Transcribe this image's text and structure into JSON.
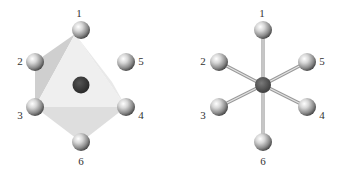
{
  "diagrams": [
    {
      "name": "octahedron-polyhedral-view",
      "center": {
        "x": 81,
        "y": 85,
        "color": "#3a3a3a"
      },
      "ligands": [
        {
          "label": "1",
          "x": 81,
          "y": 30,
          "lx": 79,
          "ly": 14
        },
        {
          "label": "2",
          "x": 35,
          "y": 62,
          "lx": 20,
          "ly": 62
        },
        {
          "label": "3",
          "x": 35,
          "y": 107,
          "lx": 20,
          "ly": 116
        },
        {
          "label": "4",
          "x": 126,
          "y": 107,
          "lx": 141,
          "ly": 116
        },
        {
          "label": "5",
          "x": 126,
          "y": 62,
          "lx": 141,
          "ly": 62
        },
        {
          "label": "6",
          "x": 81,
          "y": 142,
          "lx": 81,
          "ly": 162
        }
      ]
    },
    {
      "name": "octahedron-ball-and-stick-view",
      "center": {
        "x": 263,
        "y": 85,
        "color": "#555555"
      },
      "ligands": [
        {
          "label": "1",
          "x": 263,
          "y": 30,
          "lx": 262,
          "ly": 14
        },
        {
          "label": "2",
          "x": 219,
          "y": 62,
          "lx": 203,
          "ly": 62
        },
        {
          "label": "3",
          "x": 219,
          "y": 107,
          "lx": 203,
          "ly": 116
        },
        {
          "label": "4",
          "x": 307,
          "y": 107,
          "lx": 322,
          "ly": 116
        },
        {
          "label": "5",
          "x": 307,
          "y": 62,
          "lx": 322,
          "ly": 62
        },
        {
          "label": "6",
          "x": 263,
          "y": 142,
          "lx": 263,
          "ly": 162
        }
      ]
    }
  ],
  "colors": {
    "ball_light": "#ffffff",
    "ball_mid": "#b8b8b8",
    "ball_dark": "#4a4a4a",
    "face_light": "#ececec",
    "face_mid": "#dcdcdc",
    "face_dark": "#c8c8c8",
    "bond": "#b0b0b0"
  }
}
